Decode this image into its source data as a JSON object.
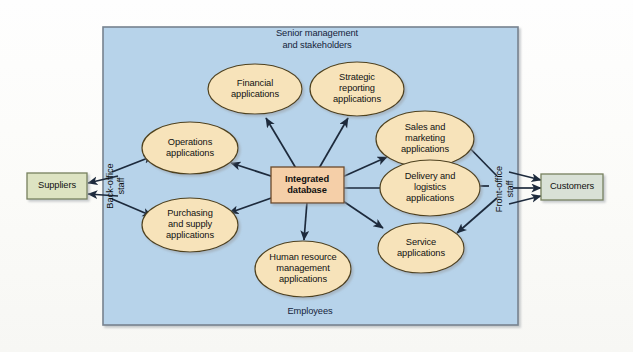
{
  "diagram": {
    "colors": {
      "zone_fill": "#b7d3ea",
      "zone_border": "#6f7f8d",
      "ellipse_fill": "#f7e3ba",
      "ellipse_border": "#5a4a28",
      "center_fill": "#f5cfa8",
      "center_border": "#6b4a2a",
      "actor_fill": "#dde3c2",
      "actor_border": "#7b8560",
      "actor_fill_alt": "#d7dfd4",
      "arrow": "#1d2a3c",
      "page_bg": "#fdfdfb"
    },
    "zone": {
      "top_label": "Senior management\nand stakeholders",
      "top_label_line1": "Senior management",
      "top_label_line2": "and stakeholders",
      "bottom_label": "Employees",
      "left_label_line1": "Back-office",
      "left_label_line2": "staff",
      "right_label_line1": "Front-office",
      "right_label_line2": "staff"
    },
    "center": {
      "line1": "Integrated",
      "line2": "database"
    },
    "actors": [
      {
        "name": "suppliers",
        "label": "Suppliers"
      },
      {
        "name": "customers",
        "label": "Customers"
      }
    ],
    "applications": [
      {
        "name": "financial",
        "line1": "Financial",
        "line2": "applications",
        "line3": ""
      },
      {
        "name": "strategic-reporting",
        "line1": "Strategic",
        "line2": "reporting",
        "line3": "applications"
      },
      {
        "name": "operations",
        "line1": "Operations",
        "line2": "applications",
        "line3": ""
      },
      {
        "name": "sales-marketing",
        "line1": "Sales and",
        "line2": "marketing",
        "line3": "applications"
      },
      {
        "name": "purchasing-supply",
        "line1": "Purchasing",
        "line2": "and supply",
        "line3": "applications"
      },
      {
        "name": "delivery-logistics",
        "line1": "Delivery and",
        "line2": "logistics",
        "line3": "applications"
      },
      {
        "name": "human-resource",
        "line1": "Human resource",
        "line2": "management",
        "line3": "applications"
      },
      {
        "name": "service",
        "line1": "Service",
        "line2": "applications",
        "line3": ""
      }
    ]
  }
}
